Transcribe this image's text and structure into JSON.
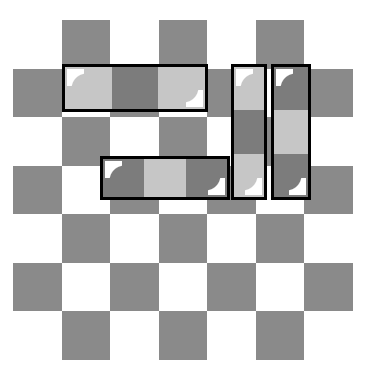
{
  "scene": {
    "title": "Checkerboard puzzle with highlighted tromino pieces",
    "background_color": "#ffffff"
  },
  "board": {
    "name": "checkerboard",
    "rows": 7,
    "columns": 7,
    "cell_size": 48.5,
    "origin_x": 13,
    "origin_y": 20,
    "dark_color": "#8a8a8a",
    "light_color": "#ffffff",
    "pattern_note": "row 0 columns 1,3,5 dark; alternating checker offset by row",
    "cells": [
      [
        "light",
        "dark",
        "light",
        "dark",
        "light",
        "dark",
        "light"
      ],
      [
        "dark",
        "light",
        "dark",
        "light",
        "dark",
        "light",
        "dark"
      ],
      [
        "light",
        "dark",
        "light",
        "dark",
        "light",
        "dark",
        "light"
      ],
      [
        "dark",
        "light",
        "dark",
        "light",
        "dark",
        "light",
        "dark"
      ],
      [
        "light",
        "dark",
        "light",
        "dark",
        "light",
        "dark",
        "light"
      ],
      [
        "dark",
        "light",
        "dark",
        "light",
        "dark",
        "light",
        "dark"
      ],
      [
        "light",
        "dark",
        "light",
        "dark",
        "light",
        "dark",
        "light"
      ]
    ]
  },
  "pieces": [
    {
      "id": "piece-1",
      "name": "horizontal-tromino-top-left",
      "orientation": "horizontal",
      "length": 3,
      "row": 1,
      "column": 1,
      "x": 62,
      "y": 64,
      "width": 146,
      "height": 48,
      "border_color": "#000000",
      "segments": [
        "light",
        "dark",
        "light"
      ],
      "gloss": [
        "top-left",
        "bottom-right"
      ]
    },
    {
      "id": "piece-2",
      "name": "horizontal-tromino-middle",
      "orientation": "horizontal",
      "length": 3,
      "row": 3,
      "column": 2,
      "x": 100,
      "y": 156,
      "width": 130,
      "height": 44,
      "border_color": "#000000",
      "segments": [
        "dark",
        "light",
        "dark"
      ],
      "gloss": [
        "top-left",
        "bottom-right"
      ]
    },
    {
      "id": "piece-3",
      "name": "vertical-tromino-right-inner",
      "orientation": "vertical",
      "length": 3,
      "row": 1,
      "column": 5,
      "x": 231,
      "y": 64,
      "width": 36,
      "height": 136,
      "border_color": "#000000",
      "segments": [
        "light",
        "dark",
        "light"
      ],
      "gloss": [
        "top-left",
        "bottom-right"
      ]
    },
    {
      "id": "piece-4",
      "name": "vertical-tromino-right-outer",
      "orientation": "vertical",
      "length": 3,
      "row": 1,
      "column": 6,
      "x": 271,
      "y": 64,
      "width": 40,
      "height": 136,
      "border_color": "#000000",
      "segments": [
        "dark",
        "light",
        "dark"
      ],
      "gloss": [
        "top-left",
        "bottom-right"
      ]
    }
  ],
  "colors": {
    "board_dark": "#8a8a8a",
    "board_light": "#ffffff",
    "piece_light": "#c6c6c6",
    "piece_dark": "#7c7c7c",
    "piece_outline": "#000000",
    "gloss": "#ffffff"
  }
}
